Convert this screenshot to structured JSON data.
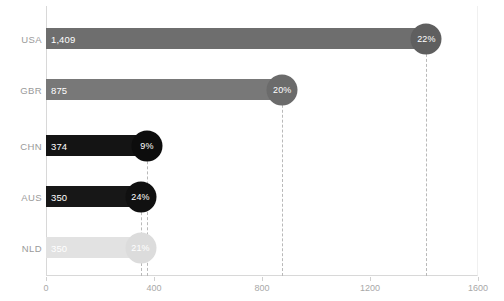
{
  "chart_data": {
    "type": "bar",
    "orientation": "horizontal",
    "title": "",
    "subtitle": "",
    "xlabel": "",
    "ylabel": "",
    "xlim": [
      0,
      1600
    ],
    "ylim": null,
    "grid": "dashed-droplines",
    "legend": null,
    "xticks": [
      {
        "value": 0,
        "label": "0"
      },
      {
        "value": 400,
        "label": "400"
      },
      {
        "value": 800,
        "label": "800"
      },
      {
        "value": 1200,
        "label": "1200"
      },
      {
        "value": 1600,
        "label": "1600"
      }
    ],
    "categories": [
      "USA",
      "GBR",
      "CHN",
      "AUS",
      "NLD"
    ],
    "values": [
      1409,
      875,
      374,
      350,
      350
    ],
    "value_labels": [
      "1,409",
      "875",
      "374",
      "350",
      "350"
    ],
    "secondary_labels": [
      "22%",
      "20%",
      "9%",
      "24%",
      "21%"
    ],
    "secondary_values": [
      22,
      20,
      9,
      24,
      21
    ],
    "series": [
      {
        "name": "value",
        "values": [
          1409,
          875,
          374,
          350,
          350
        ]
      },
      {
        "name": "percent",
        "values": [
          22,
          20,
          9,
          24,
          21
        ]
      }
    ],
    "bars": [
      {
        "category": "USA",
        "value": 1409,
        "value_label": "1,409",
        "percent_label": "22%",
        "bar_color": "#6e6e6e",
        "endcap_color": "#5f5f5f"
      },
      {
        "category": "GBR",
        "value": 875,
        "value_label": "875",
        "percent_label": "20%",
        "bar_color": "#787878",
        "endcap_color": "#6b6b6b"
      },
      {
        "category": "CHN",
        "value": 374,
        "value_label": "374",
        "percent_label": "9%",
        "bar_color": "#141414",
        "endcap_color": "#0d0d0d"
      },
      {
        "category": "AUS",
        "value": 350,
        "value_label": "350",
        "percent_label": "24%",
        "bar_color": "#171717",
        "endcap_color": "#101010"
      },
      {
        "category": "NLD",
        "value": 350,
        "value_label": "350",
        "percent_label": "21%",
        "bar_color": "#e2e2e2",
        "endcap_color": "#dcdcdc"
      }
    ],
    "colors": {
      "axis": "#d8d8d8",
      "gridline": "#b9b9b9",
      "tick_label": "#a8a8a8",
      "category_label": "#9a9a9a",
      "background": "#ffffff",
      "value_text": "#ffffff"
    }
  }
}
